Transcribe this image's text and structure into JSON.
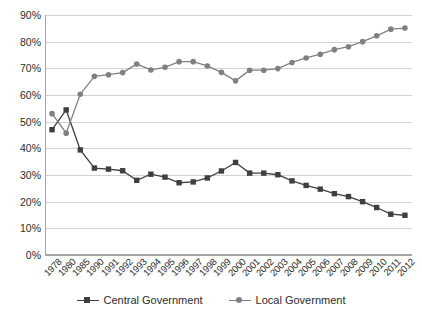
{
  "chart_data": {
    "type": "line",
    "title": "",
    "subtitle": "",
    "xlabel": "",
    "ylabel": "",
    "ylim": [
      0,
      90
    ],
    "ytick_labels": [
      "0%",
      "10%",
      "20%",
      "30%",
      "40%",
      "50%",
      "60%",
      "70%",
      "80%",
      "90%"
    ],
    "ytick_values": [
      0,
      10,
      20,
      30,
      40,
      50,
      60,
      70,
      80,
      90
    ],
    "grid": true,
    "legend_position": "bottom",
    "categories": [
      "1978",
      "1980",
      "1985",
      "1990",
      "1991",
      "1992",
      "1993",
      "1994",
      "1995",
      "1996",
      "1997",
      "1998",
      "1999",
      "2000",
      "2001",
      "2002",
      "2003",
      "2004",
      "2005",
      "2006",
      "2007",
      "2008",
      "2009",
      "2010",
      "2011",
      "2012"
    ],
    "series": [
      {
        "name": "Central Government",
        "color": "#3f3f3f",
        "marker": "square",
        "values": [
          47.0,
          54.4,
          39.4,
          32.6,
          32.2,
          31.6,
          28.0,
          30.3,
          29.2,
          27.1,
          27.4,
          28.9,
          31.5,
          34.7,
          30.7,
          30.7,
          30.1,
          27.8,
          26.1,
          24.7,
          23.0,
          21.9,
          20.0,
          17.8,
          15.3,
          14.9
        ]
      },
      {
        "name": "Local Government",
        "color": "#808080",
        "marker": "circle",
        "values": [
          53.0,
          45.7,
          60.3,
          67.0,
          67.6,
          68.4,
          71.6,
          69.4,
          70.4,
          72.5,
          72.5,
          70.9,
          68.5,
          65.3,
          69.3,
          69.3,
          69.9,
          72.2,
          73.9,
          75.3,
          77.0,
          78.1,
          80.0,
          82.2,
          84.7,
          85.1
        ]
      }
    ]
  },
  "legend": {
    "items": [
      {
        "label": "Central Government"
      },
      {
        "label": "Local Government"
      }
    ]
  },
  "colors": {
    "central": "#3f3f3f",
    "local": "#808080",
    "grid": "#d3d3d3",
    "axis": "#a6a6a6",
    "text": "#2b2b2b",
    "background": "#ffffff"
  }
}
